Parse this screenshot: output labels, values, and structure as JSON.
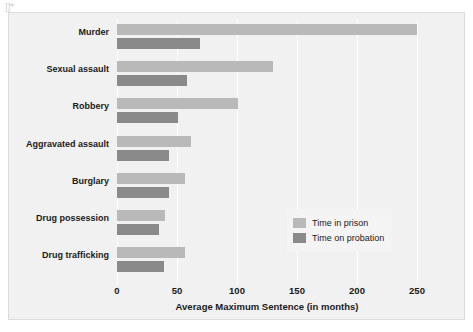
{
  "artifact": {
    "mark": "]]*"
  },
  "chart_data": {
    "type": "bar",
    "orientation": "horizontal",
    "grouped": true,
    "title": "",
    "xlabel": "Average Maximum Sentence (in months)",
    "ylabel": "",
    "xlim": [
      0,
      250
    ],
    "xticks": [
      0,
      50,
      100,
      150,
      200,
      250
    ],
    "xtick_labels": [
      "0",
      "50",
      "100",
      "150",
      "200",
      "250"
    ],
    "grid": "vertical-white",
    "legend_position": "inside-lower-right",
    "categories": [
      "Murder",
      "Sexual assault",
      "Robbery",
      "Aggravated assault",
      "Burglary",
      "Drug possession",
      "Drug trafficking"
    ],
    "series": [
      {
        "name": "Time in prison",
        "color": "#b9b9b9",
        "values": [
          250,
          130,
          101,
          62,
          57,
          40,
          57
        ]
      },
      {
        "name": "Time on probation",
        "color": "#8a8a8a",
        "values": [
          69,
          58,
          51,
          43,
          43,
          35,
          39
        ]
      }
    ],
    "legend": [
      "Time in prison",
      "Time on probation"
    ],
    "background_color": "#f1f1f1",
    "page_background": "#ffffff"
  }
}
